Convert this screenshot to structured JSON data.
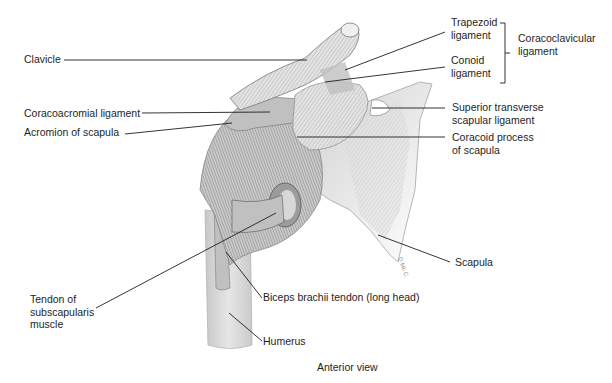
{
  "figure": {
    "caption": "Anterior view",
    "signature": "D.Mc.C.",
    "colors": {
      "background": "#ffffff",
      "ink": "#1e1e1e",
      "bone_fill": "#d9d9d9",
      "bone_shadow": "#a8a8a8",
      "ligament_fill": "#c4c4c4",
      "leader_line": "#1e1e1e"
    }
  },
  "labels": {
    "clavicle": "Clavicle",
    "trapezoid_line1": "Trapezoid",
    "trapezoid_line2": "ligament",
    "conoid_line1": "Conoid",
    "conoid_line2": "ligament",
    "coracoclavicular_line1": "Coracoclavicular",
    "coracoclavicular_line2": "ligament",
    "coracoacromial": "Coracoacromial ligament",
    "acromion": "Acromion of scapula",
    "superior_transverse_line1": "Superior transverse",
    "superior_transverse_line2": "scapular ligament",
    "coracoid_line1": "Coracoid process",
    "coracoid_line2": "of scapula",
    "scapula": "Scapula",
    "subscapularis_line1": "Tendon of",
    "subscapularis_line2": "subscapularis",
    "subscapularis_line3": "muscle",
    "biceps": "Biceps brachii tendon (long head)",
    "humerus": "Humerus"
  }
}
